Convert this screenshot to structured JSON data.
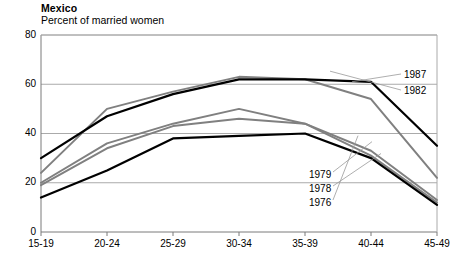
{
  "header": {
    "title": "Mexico",
    "subtitle": "Percent of married women"
  },
  "chart_data": {
    "type": "line",
    "title": "Mexico",
    "subtitle": "Percent of married women",
    "xlabel": "",
    "ylabel": "Percent of married women",
    "categories": [
      "15-19",
      "20-24",
      "25-29",
      "30-34",
      "35-39",
      "40-44",
      "45-49"
    ],
    "ylim": [
      0,
      80
    ],
    "yticks": [
      0,
      20,
      40,
      60,
      80
    ],
    "grid": "horizontal",
    "legend_position": "inline-callout",
    "series": [
      {
        "name": "1987",
        "color": "#000000",
        "values": [
          30,
          47,
          56,
          62,
          62,
          61,
          35
        ]
      },
      {
        "name": "1982",
        "color": "#808080",
        "values": [
          24,
          50,
          57,
          63,
          62,
          54,
          22
        ]
      },
      {
        "name": "1979",
        "color": "#808080",
        "values": [
          19,
          34,
          43,
          46,
          44,
          33,
          13
        ]
      },
      {
        "name": "1978",
        "color": "#808080",
        "values": [
          20,
          36,
          44,
          50,
          44,
          31,
          12
        ]
      },
      {
        "name": "1976",
        "color": "#000000",
        "values": [
          14,
          25,
          38,
          39,
          40,
          30,
          11
        ]
      }
    ]
  },
  "axes": {
    "ytick_labels": [
      "80",
      "60",
      "40",
      "20",
      "0"
    ],
    "xtick_labels": [
      "15-19",
      "20-24",
      "25-29",
      "30-34",
      "35-39",
      "40-44",
      "45-49"
    ]
  },
  "legend": {
    "items": [
      {
        "label": "1987"
      },
      {
        "label": "1982"
      },
      {
        "label": "1979"
      },
      {
        "label": "1978"
      },
      {
        "label": "1976"
      }
    ]
  },
  "colors": {
    "line_black": "#000000",
    "line_gray": "#808080",
    "gridline": "#aaaaaa",
    "axis": "#7a7a7a",
    "background": "#ffffff"
  }
}
